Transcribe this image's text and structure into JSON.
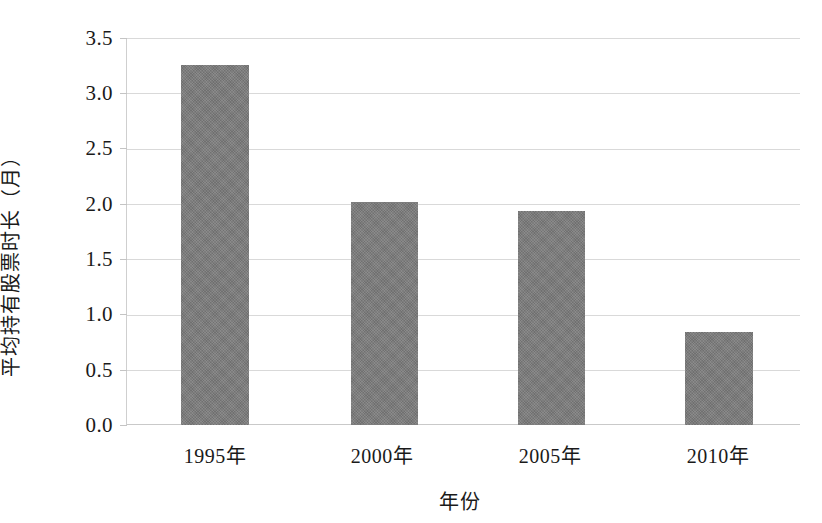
{
  "chart_data": {
    "type": "bar",
    "title": "",
    "subtitle": "",
    "xlabel": "年份",
    "ylabel": "平均持有股票时长（月）",
    "categories": [
      "1995年",
      "2000年",
      "2005年",
      "2010年"
    ],
    "values": [
      3.26,
      2.02,
      1.94,
      0.84
    ],
    "series": [
      {
        "name": "平均持有股票时长（月）",
        "values": [
          3.26,
          2.02,
          1.94,
          0.84
        ]
      }
    ],
    "ylim": [
      0.0,
      3.5
    ],
    "ytick_labels": [
      "3.5",
      "3.0",
      "2.5",
      "2.0",
      "1.5",
      "1.0",
      "0.5",
      "0.0"
    ],
    "ytick_values": [
      3.5,
      3.0,
      2.5,
      2.0,
      1.5,
      1.0,
      0.5,
      0.0
    ],
    "grid": true,
    "legend": false,
    "legend_position": "none",
    "annotations": [],
    "bar_color": "#7c7c7c",
    "gridline_color": "#d9d9d9",
    "axis_color": "#cfcfcf",
    "background_color": "#ffffff",
    "text_color": "#1a1a1a"
  }
}
